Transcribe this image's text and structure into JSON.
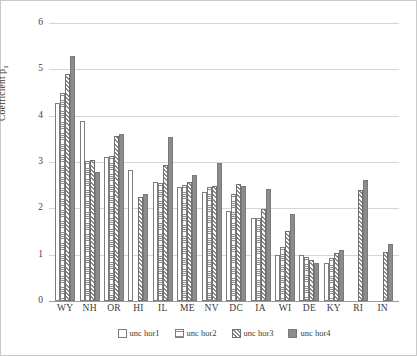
{
  "chart_data": {
    "type": "bar",
    "title": "",
    "xlabel": "",
    "ylabel": "Coefficient β",
    "ylabel_sub": "1",
    "ylim": [
      0,
      6
    ],
    "yticks": [
      0,
      1,
      2,
      3,
      4,
      5,
      6
    ],
    "ytick_labels": [
      "0",
      "1",
      "2",
      "3",
      "4",
      "5",
      "6"
    ],
    "grid": true,
    "legend_position": "bottom",
    "categories": [
      "WY",
      "NH",
      "OR",
      "HI",
      "IL",
      "ME",
      "NV",
      "DC",
      "IA",
      "WI",
      "DE",
      "KY",
      "RI",
      "IN"
    ],
    "series": [
      {
        "name": "unc hor1",
        "fill": "white",
        "values": [
          4.27,
          3.89,
          3.1,
          2.82,
          2.57,
          2.47,
          2.35,
          1.95,
          1.79,
          1.0,
          1.0,
          0.82,
          null,
          null
        ]
      },
      {
        "name": "unc hor2",
        "fill": "horizontal-lines",
        "values": [
          4.5,
          3.03,
          3.12,
          null,
          2.54,
          2.51,
          2.45,
          2.31,
          1.8,
          1.16,
          0.95,
          0.92,
          null,
          null
        ]
      },
      {
        "name": "unc hor3",
        "fill": "diagonal-hatch",
        "values": [
          4.9,
          3.04,
          3.57,
          2.25,
          2.94,
          2.56,
          2.49,
          2.53,
          1.99,
          1.52,
          0.88,
          1.04,
          2.4,
          1.06
        ]
      },
      {
        "name": "unc hor4",
        "fill": "solid-gray",
        "values": [
          5.28,
          2.79,
          3.61,
          2.31,
          3.55,
          2.73,
          2.98,
          2.48,
          2.41,
          1.87,
          0.83,
          1.11,
          2.61,
          1.23
        ]
      }
    ]
  },
  "legend": {
    "items": [
      {
        "label": "unc hor1"
      },
      {
        "label": "unc hor2"
      },
      {
        "label": "unc hor3"
      },
      {
        "label": "unc hor4"
      }
    ]
  },
  "colors": {
    "series4": "#8c8c8c",
    "gridline": "#d6d6d6",
    "axis": "#9a9a9a",
    "text": "#3a3a3a"
  }
}
